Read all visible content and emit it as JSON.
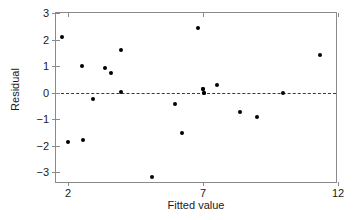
{
  "chart_data": {
    "type": "scatter",
    "title": "",
    "xlabel": "Fitted value",
    "ylabel": "Residual",
    "xlim": [
      1.55,
      12.0
    ],
    "ylim": [
      -3.45,
      3.0
    ],
    "xticks": [
      2,
      7,
      12
    ],
    "xtick_labels": [
      "2",
      "7",
      "12"
    ],
    "yticks": [
      3,
      2,
      1,
      0,
      -1,
      -2,
      -3
    ],
    "ytick_labels": [
      "3",
      "2",
      "1",
      "0",
      "−1",
      "−2",
      "−3"
    ],
    "grid": false,
    "legend": false,
    "reference_line": {
      "axis": "y",
      "value": 0,
      "style": "dashed",
      "color": "#3a3a3a",
      "label": "zero-residual-line"
    },
    "marker": {
      "shape": "circle",
      "filled": true,
      "color": "#000000",
      "size_px": 4
    },
    "point_count": 22,
    "points": [
      {
        "x": 1.79,
        "y": 2.08
      },
      {
        "x": 2.0,
        "y": -1.88
      },
      {
        "x": 2.52,
        "y": 1.01
      },
      {
        "x": 2.56,
        "y": -1.79
      },
      {
        "x": 2.93,
        "y": -0.25
      },
      {
        "x": 3.35,
        "y": 0.93
      },
      {
        "x": 3.58,
        "y": 0.72
      },
      {
        "x": 3.95,
        "y": 1.62
      },
      {
        "x": 3.97,
        "y": 0.01
      },
      {
        "x": 5.1,
        "y": -3.19
      },
      {
        "x": 5.95,
        "y": -0.45
      },
      {
        "x": 6.22,
        "y": -1.52
      },
      {
        "x": 6.83,
        "y": 2.45
      },
      {
        "x": 6.98,
        "y": 0.14
      },
      {
        "x": 7.02,
        "y": -0.03
      },
      {
        "x": 7.52,
        "y": 0.27
      },
      {
        "x": 8.37,
        "y": -0.74
      },
      {
        "x": 8.99,
        "y": -0.93
      },
      {
        "x": 9.98,
        "y": 0.0
      },
      {
        "x": 11.33,
        "y": 1.43
      },
      {
        "x": 6.98,
        "y": 0.14
      },
      {
        "x": 7.02,
        "y": -0.03
      }
    ]
  },
  "colors": {
    "background": "#ffffff",
    "axis": "#8a8a8a",
    "text": "#1a1a1a",
    "marker": "#000000",
    "reference_line": "#3a3a3a"
  }
}
